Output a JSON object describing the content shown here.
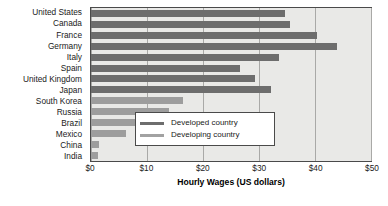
{
  "chart_data": {
    "type": "bar",
    "orientation": "horizontal",
    "title": "",
    "xlabel": "Hourly Wages (US dollars)",
    "ylabel": "",
    "xlim": [
      0,
      50
    ],
    "xticks": [
      0,
      10,
      20,
      30,
      40,
      50
    ],
    "xtick_labels": [
      "$0",
      "$10",
      "$20",
      "$30",
      "$40",
      "$50"
    ],
    "grid": true,
    "legend_position": "center-right",
    "categories": [
      "United States",
      "Canada",
      "France",
      "Germany",
      "Italy",
      "Spain",
      "United Kingdom",
      "Japan",
      "South Korea",
      "Russia",
      "Brazil",
      "Mexico",
      "China",
      "India"
    ],
    "values": [
      34.7,
      35.6,
      40.4,
      43.9,
      33.5,
      26.6,
      29.3,
      32.1,
      16.5,
      13.9,
      9.5,
      6.3,
      1.5,
      1.2
    ],
    "groups": [
      "Developed country",
      "Developed country",
      "Developed country",
      "Developed country",
      "Developed country",
      "Developed country",
      "Developed country",
      "Developed country",
      "Developing country",
      "Developing country",
      "Developing country",
      "Developing country",
      "Developing country",
      "Developing country"
    ],
    "series": [
      {
        "name": "Developed country",
        "color": "#6d6d6d",
        "points": [
          {
            "category": "United States",
            "value": 34.7
          },
          {
            "category": "Canada",
            "value": 35.6
          },
          {
            "category": "France",
            "value": 40.4
          },
          {
            "category": "Germany",
            "value": 43.9
          },
          {
            "category": "Italy",
            "value": 33.5
          },
          {
            "category": "Spain",
            "value": 26.6
          },
          {
            "category": "United Kingdom",
            "value": 29.3
          },
          {
            "category": "Japan",
            "value": 32.1
          }
        ]
      },
      {
        "name": "Developing country",
        "color": "#9d9d9d",
        "points": [
          {
            "category": "South Korea",
            "value": 16.5
          },
          {
            "category": "Russia",
            "value": 13.9
          },
          {
            "category": "Brazil",
            "value": 9.5
          },
          {
            "category": "Mexico",
            "value": 6.3
          },
          {
            "category": "China",
            "value": 1.5
          },
          {
            "category": "India",
            "value": 1.2
          }
        ]
      }
    ],
    "legend": [
      {
        "label": "Developed country",
        "color": "#6d6d6d"
      },
      {
        "label": "Developing country",
        "color": "#9d9d9d"
      }
    ],
    "colors": {
      "developed": "#6d6d6d",
      "developing": "#9d9d9d",
      "plot_background": "#e9e9e7",
      "gridline": "#a9a9a7",
      "axis": "#4a4a4a",
      "text": "#1a1a1a"
    }
  }
}
